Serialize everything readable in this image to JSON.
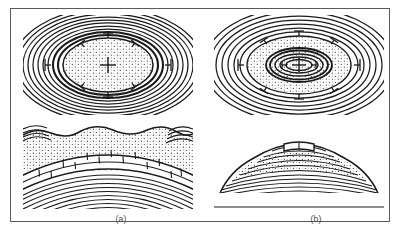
{
  "figure": {
    "domain_description": "Geological structure diagram: map view and cross-section of an anticline and a dome",
    "border_color": "#5a5a5a",
    "background": "#ffffff",
    "line_color": "#1a1a1a",
    "stipple_color": "#2b2b2b"
  },
  "panels": [
    {
      "id": "a",
      "caption": "(a)",
      "structure_name": "anticline",
      "map": {
        "name": "map-view-anticline",
        "outcrop_pattern": "elongate concentric ellipses",
        "core_fill": "stippled-sandstone",
        "center_symbol": "+",
        "dip_symbol_count": 8
      },
      "section": {
        "name": "cross-section-anticline",
        "top_surface": "wavy erosional surface",
        "layers": [
          "stippled-sandstone",
          "brick-limestone",
          "laminated-shale"
        ]
      }
    },
    {
      "id": "b",
      "caption": "(b)",
      "structure_name": "dome",
      "map": {
        "name": "map-view-dome",
        "outcrop_pattern": "nested concentric ellipses",
        "core_fill": "stippled-sandstone",
        "center_symbol": "+",
        "dip_symbol_count": 8
      },
      "section": {
        "name": "cross-section-dome",
        "top_surface": "dome shaped hill",
        "layers": [
          "brick-limestone",
          "laminated-shale",
          "stippled-sandstone"
        ]
      }
    }
  ]
}
